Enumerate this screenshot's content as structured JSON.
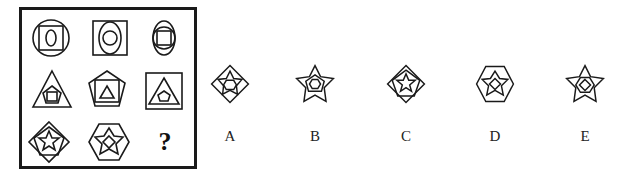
{
  "puzzle": {
    "title": "3x3 figure matrix with missing cell",
    "grid": [
      [
        {
          "outer": "circle",
          "middle": "square",
          "inner": "ellipse"
        },
        {
          "outer": "square",
          "middle": "ellipse",
          "inner": "circle"
        },
        {
          "outer": "ellipse",
          "middle": "circle",
          "inner": "square"
        }
      ],
      [
        {
          "outer": "triangle",
          "middle": "pentagon",
          "inner": "square"
        },
        {
          "outer": "pentagon",
          "middle": "square",
          "inner": "triangle"
        },
        {
          "outer": "square",
          "middle": "triangle",
          "inner": "pentagon"
        }
      ],
      [
        {
          "outer": "diamond",
          "middle": "pentagon",
          "inner": "star"
        },
        {
          "outer": "hexagon",
          "middle": "star",
          "inner": "diamond"
        },
        {
          "missing": true,
          "symbol": "?"
        }
      ]
    ],
    "question_mark": "?"
  },
  "options": [
    {
      "label": "A",
      "outer": "diamond",
      "middle": "star",
      "inner": "hexagon"
    },
    {
      "label": "B",
      "outer": "star",
      "middle": "pentagon",
      "inner": "hexagon"
    },
    {
      "label": "C",
      "outer": "diamond",
      "middle": "pentagon",
      "inner": "star"
    },
    {
      "label": "D",
      "outer": "hexagon",
      "middle": "star",
      "inner": "diamond"
    },
    {
      "label": "E",
      "outer": "star",
      "middle": "hexagon",
      "inner": "diamond"
    }
  ],
  "colors": {
    "stroke": "#1a1a1a",
    "background": "#ffffff"
  }
}
